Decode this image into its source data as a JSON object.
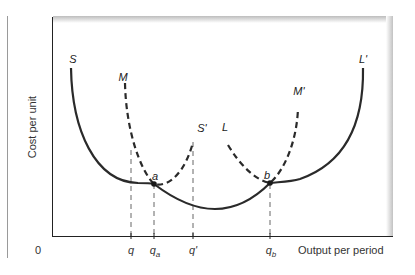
{
  "axes": {
    "y_label": "Cost per unit",
    "x_label": "Output per period",
    "origin_label": "0"
  },
  "x_ticks": [
    {
      "id": "q",
      "base": "q",
      "sub": ""
    },
    {
      "id": "qa",
      "base": "q",
      "sub": "a"
    },
    {
      "id": "q_prime",
      "base": "q'",
      "sub": ""
    },
    {
      "id": "qb",
      "base": "q",
      "sub": "b"
    }
  ],
  "curve_labels": {
    "S": "S",
    "S_prime": "S'",
    "M": "M",
    "M_prime": "M'",
    "L": "L",
    "L_prime": "L'"
  },
  "points": {
    "a": "a",
    "b": "b"
  },
  "colors": {
    "curve": "#2a2a2a",
    "guide": "#555555",
    "frame": "#222222"
  }
}
